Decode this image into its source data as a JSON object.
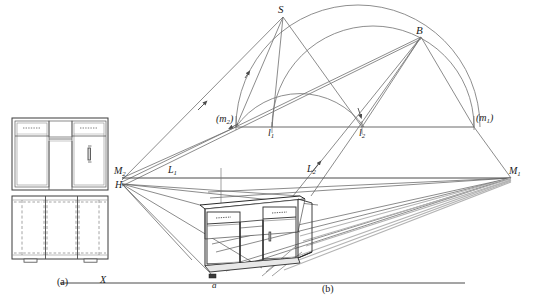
{
  "figure": {
    "subfigures": [
      {
        "id": "a",
        "caption": "(a)",
        "description": "orthographic front elevation and plan of the desk unit"
      },
      {
        "id": "b",
        "caption": "(b)",
        "description": "perspective view with sun-shadow construction"
      }
    ]
  },
  "labels": {
    "sun_point": "S",
    "sun_base_point": "B",
    "measuring_point_left": "(m",
    "measuring_point_left_sub": "2",
    "measuring_point_left_close": ")",
    "measuring_point_right": "(m",
    "measuring_point_right_sub": "1",
    "measuring_point_right_close": ")",
    "small_l1": "l",
    "small_l1_sub": "1",
    "small_l2": "l",
    "small_l2_sub": "2",
    "big_l1": "L",
    "big_l1_sub": "1",
    "big_l2": "L",
    "big_l2_sub": "2",
    "vanishing_left": "M",
    "vanishing_left_sub": "2",
    "vanishing_right": "M",
    "vanishing_right_sub": "1",
    "station_height": "H",
    "ground_line": "X",
    "ground_point": "a"
  },
  "colors": {
    "line": "#3b3b3b",
    "heavy_line": "#1f1f1f",
    "light_line": "#8d8d8d",
    "construction_line": "#6f6f6f",
    "shadow_fill": "#bdbdbd",
    "background": "#ffffff",
    "text": "#1a1a1a"
  },
  "geometry": {
    "horizon_y": 178,
    "ground_line_y": 283,
    "measuring_line_y": 127,
    "vanishing_point_left": [
      122,
      178
    ],
    "vanishing_point_right": [
      511,
      178
    ],
    "measuring_point_left": [
      241,
      127
    ],
    "measuring_point_right": [
      474,
      127
    ],
    "sun_point": [
      283,
      17
    ],
    "sun_base_point": [
      421,
      37
    ],
    "l1": [
      272,
      127
    ],
    "l2": [
      362,
      127
    ],
    "station_point": [
      122,
      184
    ],
    "ground_point_a": [
      212,
      279
    ]
  }
}
